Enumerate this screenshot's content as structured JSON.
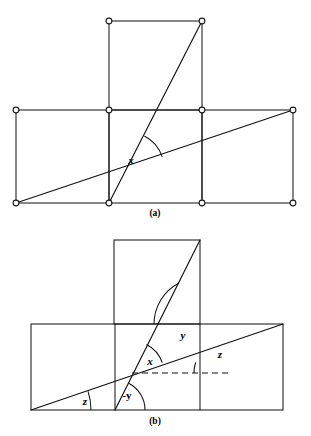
{
  "figure": {
    "background_color": "#ffffff",
    "line_color": "#111111",
    "width": 311,
    "height": 436
  },
  "panels": [
    {
      "id": "panel-a",
      "caption": "(a)",
      "caption_x": 155,
      "caption_y": 214,
      "description": "Three unit squares in a T arrangement with grid vertices marked by small circles, crossed by two diagonal lines meeting at angle x",
      "squares": [
        {
          "name": "top-square",
          "x": 109,
          "y": 21,
          "w": 93,
          "h": 89
        },
        {
          "name": "bottom-left-square",
          "x": 16,
          "y": 110,
          "w": 93,
          "h": 93
        },
        {
          "name": "bottom-middle-square",
          "x": 109,
          "y": 110,
          "w": 93,
          "h": 93
        },
        {
          "name": "bottom-right-square",
          "x": 202,
          "y": 110,
          "w": 91,
          "h": 93
        }
      ],
      "nodes": [
        {
          "name": "node-top-left",
          "x": 109,
          "y": 21
        },
        {
          "name": "node-top-right",
          "x": 202,
          "y": 21
        },
        {
          "name": "node-mid-far-left",
          "x": 16,
          "y": 110
        },
        {
          "name": "node-mid-left",
          "x": 109,
          "y": 110
        },
        {
          "name": "node-mid-right",
          "x": 202,
          "y": 110
        },
        {
          "name": "node-mid-far-right",
          "x": 293,
          "y": 110
        },
        {
          "name": "node-bottom-far-left",
          "x": 16,
          "y": 203
        },
        {
          "name": "node-bottom-left",
          "x": 109,
          "y": 203
        },
        {
          "name": "node-bottom-right",
          "x": 202,
          "y": 203
        },
        {
          "name": "node-bottom-far-right",
          "x": 293,
          "y": 203
        }
      ],
      "diagonals": [
        {
          "name": "steep-diagonal",
          "x1": 109,
          "y1": 203,
          "x2": 202,
          "y2": 21
        },
        {
          "name": "shallow-diagonal",
          "x1": 16,
          "y1": 203,
          "x2": 293,
          "y2": 110
        }
      ],
      "angles": [
        {
          "name": "angle-x",
          "label": "x",
          "label_x": 131,
          "label_y": 161,
          "vertex_x": 128,
          "vertex_y": 168,
          "radius": 36,
          "start_deg": 297,
          "end_deg": 342
        }
      ]
    },
    {
      "id": "panel-b",
      "caption": "(b)",
      "caption_x": 155,
      "caption_y": 422,
      "description": "Same T arrangement without vertex circles, with a dashed horizontal reference line and four marked angles x, y, -y and z",
      "squares": [
        {
          "name": "top-square",
          "x": 114,
          "y": 240,
          "w": 86,
          "h": 84
        },
        {
          "name": "bottom-rectangle",
          "x": 31,
          "y": 324,
          "w": 252,
          "h": 86
        }
      ],
      "verticals": [
        {
          "name": "left-inner-vertical",
          "x": 115,
          "y1": 324,
          "y2": 410
        },
        {
          "name": "right-inner-vertical",
          "x": 200,
          "y1": 324,
          "y2": 410
        }
      ],
      "diagonals": [
        {
          "name": "steep-diagonal",
          "x1": 115,
          "y1": 410,
          "x2": 200,
          "y2": 240
        },
        {
          "name": "shallow-diagonal",
          "x1": 31,
          "y1": 410,
          "x2": 283,
          "y2": 324
        }
      ],
      "dashed_reference": {
        "name": "horizontal-dashed-reference",
        "x1": 132,
        "y1": 373,
        "x2": 228,
        "y2": 373
      },
      "angles": [
        {
          "name": "angle-y-upper",
          "label": "y",
          "label_x": 183,
          "label_y": 336,
          "vertex_x": 200,
          "vertex_y": 324,
          "radius": 46,
          "start_deg": 180,
          "end_deg": 243
        },
        {
          "name": "angle-x",
          "label": "x",
          "label_x": 150,
          "label_y": 362,
          "vertex_x": 132,
          "vertex_y": 373,
          "radius": 32,
          "start_deg": 297,
          "end_deg": 341
        },
        {
          "name": "angle-z-right",
          "label": "z",
          "label_x": 220,
          "label_y": 355,
          "vertex_x": 228,
          "vertex_y": 373,
          "radius": 34,
          "start_deg": 180,
          "end_deg": 198
        },
        {
          "name": "angle-neg-y-lower",
          "label": "-y",
          "label_x": 127,
          "label_y": 396,
          "vertex_x": 115,
          "vertex_y": 410,
          "radius": 30,
          "start_deg": 297,
          "end_deg": 360
        },
        {
          "name": "angle-z-left",
          "label": "z",
          "label_x": 85,
          "label_y": 402,
          "vertex_x": 31,
          "vertex_y": 410,
          "radius": 60,
          "start_deg": 342,
          "end_deg": 360
        }
      ]
    }
  ]
}
